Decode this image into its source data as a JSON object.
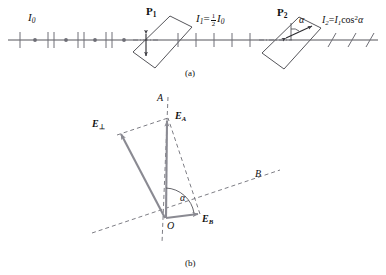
{
  "figure": {
    "panel_a": {
      "caption": "(a)",
      "labels": {
        "incident_intensity": "I",
        "incident_intensity_sub": "0",
        "polarizer1": "P",
        "polarizer1_sub": "1",
        "polarizer2": "P",
        "polarizer2_sub": "2",
        "middle_intensity_lhs": "I",
        "middle_intensity_lhs_sub": "1",
        "middle_intensity_eq": "=",
        "middle_fraction_num": "1",
        "middle_fraction_den": "2",
        "middle_intensity_rhs": "I",
        "middle_intensity_rhs_sub": "0",
        "output_intensity_lhs": "I",
        "output_intensity_lhs_sub": "2",
        "output_intensity_eq": "=",
        "output_intensity_rhs": "I",
        "output_intensity_rhs_sub": "1",
        "output_cos": "cos",
        "output_power": "2",
        "output_angle": "α",
        "angle_alpha": "α"
      },
      "elements": {
        "optical_axis": "optical-axis-line",
        "unpolarized_beam": "unpolarized-light-markers",
        "polarized_beam_1": "vertically-polarized-markers",
        "polarized_beam_2": "obliquely-polarized-markers",
        "transmission_axis_1": "vertical-double-arrow",
        "transmission_axis_2": "tilted-double-arrow"
      }
    },
    "panel_b": {
      "caption": "(b)",
      "labels": {
        "axis_a": "A",
        "axis_b": "B",
        "origin": "O",
        "vector_perp": "E",
        "vector_perp_sub": "⊥",
        "vector_a": "E",
        "vector_a_sub": "A",
        "vector_b": "E",
        "vector_b_sub": "B",
        "angle_alpha": "α"
      },
      "elements": {
        "axis_a_line": "dashed-axis-a",
        "axis_b_line": "dashed-axis-b",
        "construction_lines": "dashed-parallelogram",
        "angle_arc": "alpha-arc"
      }
    },
    "colors": {
      "line": "#55555a",
      "vector": "#8a8a92",
      "text": "#111111",
      "dash": "#6e6e76"
    }
  }
}
